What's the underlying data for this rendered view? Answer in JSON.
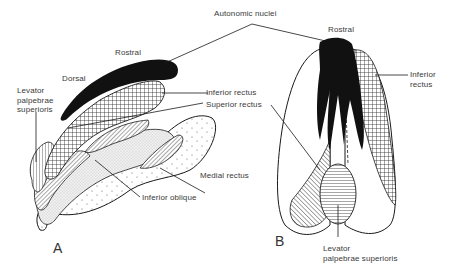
{
  "figure": {
    "panels": [
      {
        "id": "A",
        "label": "A",
        "view": "lateral"
      },
      {
        "id": "B",
        "label": "B",
        "view": "dorsal"
      }
    ]
  },
  "labels": {
    "autonomic_nuclei": "Autonomic nuclei",
    "rostral_a": "Rostral",
    "dorsal_a": "Dorsal",
    "levator_a_line1": "Levator",
    "levator_a_line2": "palpebrae",
    "levator_a_line3": "superioris",
    "inferior_rectus_a": "Inferior rectus",
    "superior_rectus_a": "Superior rectus",
    "medial_rectus_a": "Medial rectus",
    "inferior_oblique_a": "Inferior oblique",
    "rostral_b": "Rostral",
    "inferior_rectus_b_line1": "Inferior",
    "inferior_rectus_b_line2": "rectus",
    "levator_b_line1": "Levator",
    "levator_b_line2": "palpebrae superioris"
  },
  "legend_patterns": {
    "autonomic_nuclei": "solid-black",
    "inferior_rectus": "crosshatch",
    "superior_rectus": "diagonal-hatch",
    "levator_palpebrae_superioris": "horizontal-lines",
    "inferior_oblique": "fine-stipple",
    "medial_rectus": "sparse-dots"
  },
  "colors": {
    "ink": "#1a1a1a",
    "text": "#3a3a3a",
    "background": "#ffffff"
  }
}
